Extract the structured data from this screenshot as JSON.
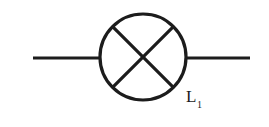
{
  "figure": {
    "kind": "circuit-symbol",
    "background_color": "#ffffff",
    "stroke_color": "#1c1c1c"
  },
  "symbol": {
    "name": "lamp",
    "shape": "circle-with-cross",
    "circle": {
      "center_x": 143,
      "center_y": 57,
      "radius": 43,
      "stroke_width": 3.2
    },
    "cross": {
      "stroke_width": 3.2,
      "diagonals": [
        {
          "x1": 112.6,
          "y1": 26.6,
          "x2": 173.4,
          "y2": 87.4
        },
        {
          "x1": 173.4,
          "y1": 26.6,
          "x2": 112.6,
          "y2": 87.4
        }
      ]
    }
  },
  "leads": [
    {
      "name": "left-lead",
      "x1": 33,
      "y1": 58,
      "x2": 101,
      "y2": 58,
      "stroke_width": 3
    },
    {
      "name": "right-lead",
      "x1": 185,
      "y1": 58,
      "x2": 250,
      "y2": 58,
      "stroke_width": 3
    }
  ],
  "labels": {
    "lamp": {
      "base": "L",
      "subscript": "1"
    }
  }
}
